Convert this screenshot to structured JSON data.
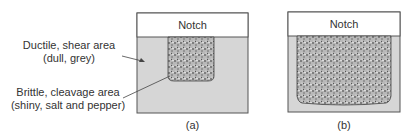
{
  "labels": {
    "ductile_line1": "Ductile, shear area",
    "ductile_line2": "(dull, grey)",
    "brittle_line1": "Brittle, cleavage area",
    "brittle_line2": "(shiny, salt and pepper)"
  },
  "panel_a": {
    "notch_label": "Notch",
    "caption": "(a)"
  },
  "panel_b": {
    "notch_label": "Notch",
    "caption": "(b)"
  },
  "colors": {
    "ductile_fill": "#d6d6d6",
    "notch_fill": "#ffffff",
    "outline": "#555555"
  }
}
